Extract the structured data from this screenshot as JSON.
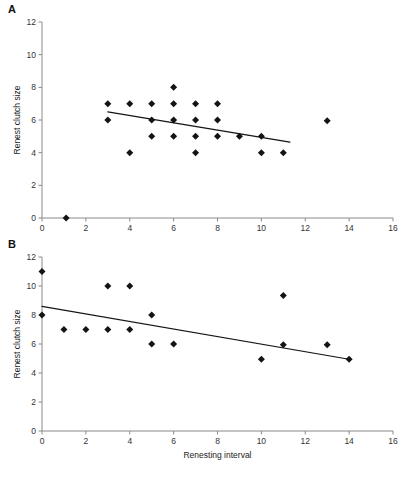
{
  "figure": {
    "panels": [
      {
        "letter": "A",
        "xlabel": "",
        "ylabel": "Renest clutch size",
        "xlim": [
          0,
          16
        ],
        "ylim": [
          0,
          12
        ],
        "xticks": [
          0,
          2,
          4,
          6,
          8,
          10,
          12,
          14,
          16
        ],
        "yticks": [
          0,
          2,
          4,
          6,
          8,
          10,
          12
        ],
        "points": [
          [
            1.1,
            0
          ],
          [
            3,
            7
          ],
          [
            3,
            6
          ],
          [
            4,
            7
          ],
          [
            4,
            4
          ],
          [
            5,
            7
          ],
          [
            5,
            6
          ],
          [
            5,
            5
          ],
          [
            6,
            8
          ],
          [
            6,
            7
          ],
          [
            6,
            6
          ],
          [
            6,
            5
          ],
          [
            7,
            7
          ],
          [
            7,
            6
          ],
          [
            7,
            5
          ],
          [
            7,
            4
          ],
          [
            8,
            7
          ],
          [
            8,
            6
          ],
          [
            8,
            5
          ],
          [
            9,
            5
          ],
          [
            10,
            5
          ],
          [
            10,
            4
          ],
          [
            11,
            4
          ],
          [
            13,
            5.95
          ]
        ],
        "fit_line": [
          [
            3.0,
            6.5
          ],
          [
            11.3,
            4.65
          ]
        ]
      },
      {
        "letter": "B",
        "xlabel": "Renesting interval",
        "ylabel": "Renest clutch size",
        "xlim": [
          0,
          16
        ],
        "ylim": [
          0,
          12
        ],
        "xticks": [
          0,
          2,
          4,
          6,
          8,
          10,
          12,
          14,
          16
        ],
        "yticks": [
          0,
          2,
          4,
          6,
          8,
          10,
          12
        ],
        "points": [
          [
            0,
            11
          ],
          [
            0,
            8
          ],
          [
            1,
            7
          ],
          [
            2,
            7
          ],
          [
            3,
            10
          ],
          [
            3,
            7
          ],
          [
            4,
            10
          ],
          [
            4,
            7
          ],
          [
            5,
            8
          ],
          [
            5,
            6
          ],
          [
            6,
            6
          ],
          [
            10,
            4.95
          ],
          [
            11,
            9.35
          ],
          [
            11,
            5.95
          ],
          [
            13,
            5.95
          ],
          [
            14,
            4.95
          ]
        ],
        "fit_line": [
          [
            0.0,
            8.6
          ],
          [
            14.0,
            4.95
          ]
        ]
      }
    ]
  },
  "chart_data": [
    {
      "type": "scatter",
      "panel": "A",
      "title": "",
      "xlabel": "",
      "ylabel": "Renest clutch size",
      "xlim": [
        0,
        16
      ],
      "ylim": [
        0,
        12
      ],
      "xticks": [
        0,
        2,
        4,
        6,
        8,
        10,
        12,
        14,
        16
      ],
      "yticks": [
        0,
        2,
        4,
        6,
        8,
        10,
        12
      ],
      "grid": false,
      "legend": "none",
      "series": [
        {
          "name": "Renest clutch size vs renesting interval (A)",
          "marker": "filled-diamond",
          "color": "#141414",
          "x": [
            1.1,
            3,
            3,
            4,
            4,
            5,
            5,
            5,
            6,
            6,
            6,
            6,
            7,
            7,
            7,
            7,
            8,
            8,
            8,
            9,
            10,
            10,
            11,
            13
          ],
          "y": [
            0,
            7,
            6,
            7,
            4,
            7,
            6,
            5,
            8,
            7,
            6,
            5,
            7,
            6,
            5,
            4,
            7,
            6,
            5,
            5,
            5,
            4,
            4,
            5.95
          ]
        },
        {
          "name": "linear fit (A)",
          "type": "line",
          "color": "#141414",
          "x": [
            3.0,
            11.3
          ],
          "y": [
            6.5,
            4.65
          ]
        }
      ]
    },
    {
      "type": "scatter",
      "panel": "B",
      "title": "",
      "xlabel": "Renesting interval",
      "ylabel": "Renest clutch size",
      "xlim": [
        0,
        16
      ],
      "ylim": [
        0,
        12
      ],
      "xticks": [
        0,
        2,
        4,
        6,
        8,
        10,
        12,
        14,
        16
      ],
      "yticks": [
        0,
        2,
        4,
        6,
        8,
        10,
        12
      ],
      "grid": false,
      "legend": "none",
      "series": [
        {
          "name": "Renest clutch size vs renesting interval (B)",
          "marker": "filled-diamond",
          "color": "#141414",
          "x": [
            0,
            0,
            1,
            2,
            3,
            3,
            4,
            4,
            5,
            5,
            6,
            10,
            11,
            11,
            13,
            14
          ],
          "y": [
            11,
            8,
            7,
            7,
            10,
            7,
            10,
            7,
            8,
            6,
            6,
            4.95,
            9.35,
            5.95,
            5.95,
            4.95
          ]
        },
        {
          "name": "linear fit (B)",
          "type": "line",
          "color": "#141414",
          "x": [
            0.0,
            14.0
          ],
          "y": [
            8.6,
            4.95
          ]
        }
      ]
    }
  ]
}
